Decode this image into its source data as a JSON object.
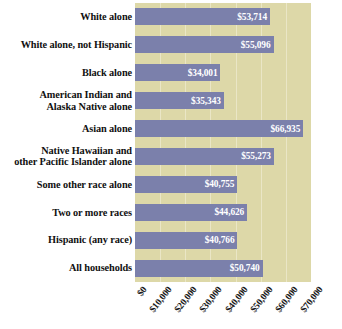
{
  "chart_data": {
    "type": "bar",
    "orientation": "horizontal",
    "title": "Median Household Income by Race and Hispanic Origin",
    "xlabel": "",
    "ylabel": "",
    "xlim": [
      0,
      70000
    ],
    "grid": true,
    "legend": "none",
    "tick_labels": [
      "$0",
      "$10,000",
      "$20,000",
      "$30,000",
      "$40,000",
      "$50,000",
      "$60,000",
      "$70,000"
    ],
    "tick_values": [
      0,
      10000,
      20000,
      30000,
      40000,
      50000,
      60000,
      70000
    ],
    "categories": [
      "White alone",
      "White alone, not Hispanic",
      "Black alone",
      "American Indian and Alaska Native alone",
      "Asian alone",
      "Native Hawaiian and other Pacific Islander alone",
      "Some other race alone",
      "Two or more races",
      "Hispanic (any race)",
      "All households"
    ],
    "values": [
      53714,
      55096,
      34001,
      35343,
      66935,
      55273,
      40755,
      44626,
      40766,
      50740
    ],
    "value_labels": [
      "$53,714",
      "$55,096",
      "$34,001",
      "$35,343",
      "$66,935",
      "$55,273",
      "$40,755",
      "$44,626",
      "$40,766",
      "$50,740"
    ],
    "colors": {
      "bar": "#7b80ab",
      "plot_background": "#ddd8a8",
      "gridline": "#eae6c6",
      "value_text": "#ffffff",
      "label_text": "#111111"
    }
  },
  "rows": [
    {
      "label_line1": "White alone",
      "label_line2": "",
      "value_label": "$53,714"
    },
    {
      "label_line1": "White alone, not Hispanic",
      "label_line2": "",
      "value_label": "$55,096"
    },
    {
      "label_line1": "Black alone",
      "label_line2": "",
      "value_label": "$34,001"
    },
    {
      "label_line1": "American Indian and",
      "label_line2": "Alaska Native alone",
      "value_label": "$35,343"
    },
    {
      "label_line1": "Asian alone",
      "label_line2": "",
      "value_label": "$66,935"
    },
    {
      "label_line1": "Native Hawaiian and",
      "label_line2": "other Pacific Islander alone",
      "value_label": "$55,273"
    },
    {
      "label_line1": "Some other race alone",
      "label_line2": "",
      "value_label": "$40,755"
    },
    {
      "label_line1": "Two or more races",
      "label_line2": "",
      "value_label": "$44,626"
    },
    {
      "label_line1": "Hispanic (any race)",
      "label_line2": "",
      "value_label": "$40,766"
    },
    {
      "label_line1": "All households",
      "label_line2": "",
      "value_label": "$50,740"
    }
  ]
}
